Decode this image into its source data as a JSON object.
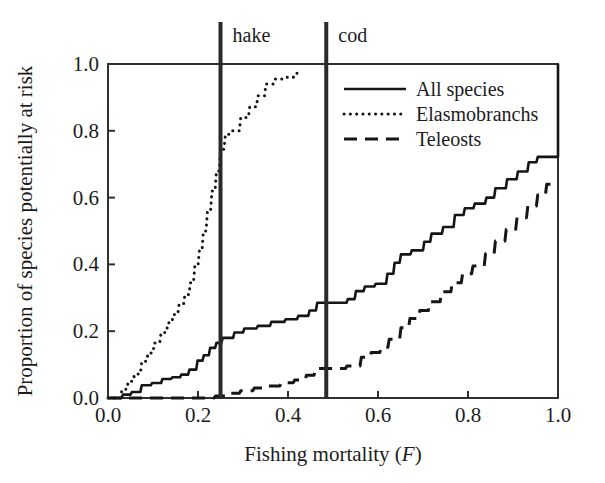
{
  "chart_data": {
    "type": "line",
    "title": "",
    "xlabel": "Fishing mortality (F)",
    "xlabel_plain": "Fishing mortality (",
    "xlabel_italic": "F",
    "xlabel_close": ")",
    "ylabel": "Proportion of species potentially at risk",
    "xlim": [
      0.0,
      1.0
    ],
    "ylim": [
      0.0,
      1.0
    ],
    "xticks": [
      "0.0",
      "0.2",
      "0.4",
      "0.6",
      "0.8",
      "1.0"
    ],
    "xtick_values": [
      0.0,
      0.2,
      0.4,
      0.6,
      0.8,
      1.0
    ],
    "yticks": [
      "0.0",
      "0.2",
      "0.4",
      "0.6",
      "0.8",
      "1.0"
    ],
    "ytick_values": [
      0.0,
      0.2,
      0.4,
      0.6,
      0.8,
      1.0
    ],
    "grid": false,
    "legend_position": "upper right",
    "line_color": "#151515",
    "axis_color": "#303030",
    "marker_color": "#2a2a2a",
    "annotations": [
      {
        "label": "hake",
        "x": 0.25,
        "type": "vertical-reference-line"
      },
      {
        "label": "cod",
        "x": 0.485,
        "type": "vertical-reference-line"
      }
    ],
    "series": [
      {
        "name": "All species",
        "style": "solid",
        "points": [
          [
            0.0,
            0.0
          ],
          [
            0.03,
            0.0
          ],
          [
            0.033,
            0.01
          ],
          [
            0.05,
            0.01
          ],
          [
            0.053,
            0.018
          ],
          [
            0.072,
            0.018
          ],
          [
            0.075,
            0.038
          ],
          [
            0.095,
            0.038
          ],
          [
            0.098,
            0.045
          ],
          [
            0.118,
            0.045
          ],
          [
            0.121,
            0.057
          ],
          [
            0.14,
            0.057
          ],
          [
            0.143,
            0.062
          ],
          [
            0.16,
            0.062
          ],
          [
            0.163,
            0.07
          ],
          [
            0.178,
            0.07
          ],
          [
            0.181,
            0.085
          ],
          [
            0.196,
            0.085
          ],
          [
            0.199,
            0.112
          ],
          [
            0.21,
            0.112
          ],
          [
            0.213,
            0.128
          ],
          [
            0.224,
            0.128
          ],
          [
            0.227,
            0.15
          ],
          [
            0.238,
            0.15
          ],
          [
            0.241,
            0.165
          ],
          [
            0.252,
            0.165
          ],
          [
            0.255,
            0.18
          ],
          [
            0.278,
            0.18
          ],
          [
            0.281,
            0.196
          ],
          [
            0.3,
            0.196
          ],
          [
            0.303,
            0.208
          ],
          [
            0.33,
            0.208
          ],
          [
            0.333,
            0.216
          ],
          [
            0.36,
            0.216
          ],
          [
            0.363,
            0.228
          ],
          [
            0.392,
            0.228
          ],
          [
            0.395,
            0.236
          ],
          [
            0.42,
            0.236
          ],
          [
            0.423,
            0.246
          ],
          [
            0.445,
            0.246
          ],
          [
            0.448,
            0.262
          ],
          [
            0.462,
            0.262
          ],
          [
            0.465,
            0.285
          ],
          [
            0.53,
            0.285
          ],
          [
            0.533,
            0.296
          ],
          [
            0.548,
            0.296
          ],
          [
            0.551,
            0.32
          ],
          [
            0.568,
            0.32
          ],
          [
            0.571,
            0.334
          ],
          [
            0.592,
            0.334
          ],
          [
            0.595,
            0.342
          ],
          [
            0.618,
            0.342
          ],
          [
            0.621,
            0.372
          ],
          [
            0.634,
            0.372
          ],
          [
            0.637,
            0.405
          ],
          [
            0.648,
            0.405
          ],
          [
            0.651,
            0.43
          ],
          [
            0.672,
            0.43
          ],
          [
            0.675,
            0.442
          ],
          [
            0.7,
            0.442
          ],
          [
            0.703,
            0.468
          ],
          [
            0.716,
            0.468
          ],
          [
            0.719,
            0.492
          ],
          [
            0.742,
            0.492
          ],
          [
            0.745,
            0.512
          ],
          [
            0.768,
            0.512
          ],
          [
            0.771,
            0.548
          ],
          [
            0.79,
            0.548
          ],
          [
            0.793,
            0.568
          ],
          [
            0.812,
            0.568
          ],
          [
            0.815,
            0.582
          ],
          [
            0.838,
            0.582
          ],
          [
            0.841,
            0.6
          ],
          [
            0.858,
            0.6
          ],
          [
            0.861,
            0.628
          ],
          [
            0.884,
            0.628
          ],
          [
            0.887,
            0.655
          ],
          [
            0.908,
            0.655
          ],
          [
            0.911,
            0.678
          ],
          [
            0.932,
            0.678
          ],
          [
            0.935,
            0.706
          ],
          [
            0.952,
            0.706
          ],
          [
            0.955,
            0.722
          ],
          [
            0.996,
            0.722
          ],
          [
            1.0,
            0.722
          ],
          [
            1.0,
            1.0
          ]
        ]
      },
      {
        "name": "Elasmobranchs",
        "style": "dotted",
        "points": [
          [
            0.0,
            0.0
          ],
          [
            0.028,
            0.0
          ],
          [
            0.031,
            0.026
          ],
          [
            0.042,
            0.026
          ],
          [
            0.045,
            0.05
          ],
          [
            0.056,
            0.05
          ],
          [
            0.059,
            0.072
          ],
          [
            0.072,
            0.072
          ],
          [
            0.075,
            0.11
          ],
          [
            0.086,
            0.11
          ],
          [
            0.089,
            0.135
          ],
          [
            0.1,
            0.135
          ],
          [
            0.103,
            0.165
          ],
          [
            0.115,
            0.165
          ],
          [
            0.118,
            0.196
          ],
          [
            0.13,
            0.196
          ],
          [
            0.133,
            0.225
          ],
          [
            0.142,
            0.225
          ],
          [
            0.145,
            0.25
          ],
          [
            0.155,
            0.25
          ],
          [
            0.158,
            0.28
          ],
          [
            0.168,
            0.28
          ],
          [
            0.171,
            0.31
          ],
          [
            0.18,
            0.31
          ],
          [
            0.183,
            0.345
          ],
          [
            0.19,
            0.345
          ],
          [
            0.193,
            0.395
          ],
          [
            0.2,
            0.395
          ],
          [
            0.203,
            0.44
          ],
          [
            0.209,
            0.44
          ],
          [
            0.212,
            0.5
          ],
          [
            0.218,
            0.5
          ],
          [
            0.221,
            0.56
          ],
          [
            0.228,
            0.56
          ],
          [
            0.231,
            0.62
          ],
          [
            0.238,
            0.62
          ],
          [
            0.241,
            0.68
          ],
          [
            0.247,
            0.68
          ],
          [
            0.25,
            0.745
          ],
          [
            0.258,
            0.745
          ],
          [
            0.261,
            0.79
          ],
          [
            0.272,
            0.79
          ],
          [
            0.275,
            0.8
          ],
          [
            0.292,
            0.8
          ],
          [
            0.295,
            0.84
          ],
          [
            0.312,
            0.84
          ],
          [
            0.315,
            0.872
          ],
          [
            0.33,
            0.872
          ],
          [
            0.333,
            0.905
          ],
          [
            0.348,
            0.905
          ],
          [
            0.351,
            0.94
          ],
          [
            0.368,
            0.94
          ],
          [
            0.371,
            0.955
          ],
          [
            0.392,
            0.955
          ],
          [
            0.395,
            0.96
          ],
          [
            0.412,
            0.96
          ],
          [
            0.415,
            0.972
          ],
          [
            0.428,
            0.972
          ]
        ]
      },
      {
        "name": "Teleosts",
        "style": "dashed",
        "points": [
          [
            0.0,
            0.0
          ],
          [
            0.236,
            0.0
          ],
          [
            0.239,
            0.006
          ],
          [
            0.262,
            0.006
          ],
          [
            0.265,
            0.014
          ],
          [
            0.292,
            0.014
          ],
          [
            0.295,
            0.022
          ],
          [
            0.322,
            0.022
          ],
          [
            0.325,
            0.03
          ],
          [
            0.352,
            0.03
          ],
          [
            0.355,
            0.036
          ],
          [
            0.382,
            0.036
          ],
          [
            0.385,
            0.046
          ],
          [
            0.412,
            0.046
          ],
          [
            0.415,
            0.054
          ],
          [
            0.438,
            0.054
          ],
          [
            0.441,
            0.068
          ],
          [
            0.458,
            0.068
          ],
          [
            0.461,
            0.088
          ],
          [
            0.528,
            0.088
          ],
          [
            0.531,
            0.096
          ],
          [
            0.56,
            0.096
          ],
          [
            0.563,
            0.122
          ],
          [
            0.582,
            0.122
          ],
          [
            0.585,
            0.136
          ],
          [
            0.604,
            0.136
          ],
          [
            0.607,
            0.152
          ],
          [
            0.622,
            0.152
          ],
          [
            0.625,
            0.176
          ],
          [
            0.648,
            0.176
          ],
          [
            0.651,
            0.21
          ],
          [
            0.668,
            0.21
          ],
          [
            0.671,
            0.238
          ],
          [
            0.69,
            0.238
          ],
          [
            0.693,
            0.262
          ],
          [
            0.712,
            0.262
          ],
          [
            0.715,
            0.288
          ],
          [
            0.738,
            0.288
          ],
          [
            0.741,
            0.318
          ],
          [
            0.762,
            0.318
          ],
          [
            0.765,
            0.345
          ],
          [
            0.785,
            0.345
          ],
          [
            0.788,
            0.372
          ],
          [
            0.808,
            0.372
          ],
          [
            0.811,
            0.395
          ],
          [
            0.836,
            0.395
          ],
          [
            0.839,
            0.432
          ],
          [
            0.858,
            0.432
          ],
          [
            0.861,
            0.47
          ],
          [
            0.882,
            0.47
          ],
          [
            0.885,
            0.505
          ],
          [
            0.906,
            0.505
          ],
          [
            0.909,
            0.54
          ],
          [
            0.93,
            0.54
          ],
          [
            0.933,
            0.575
          ],
          [
            0.952,
            0.575
          ],
          [
            0.955,
            0.608
          ],
          [
            0.972,
            0.608
          ],
          [
            0.975,
            0.64
          ],
          [
            1.0,
            0.64
          ]
        ]
      }
    ],
    "legend": [
      {
        "label": "All species",
        "style": "solid"
      },
      {
        "label": "Elasmobranchs",
        "style": "dotted"
      },
      {
        "label": "Teleosts",
        "style": "dashed"
      }
    ]
  }
}
